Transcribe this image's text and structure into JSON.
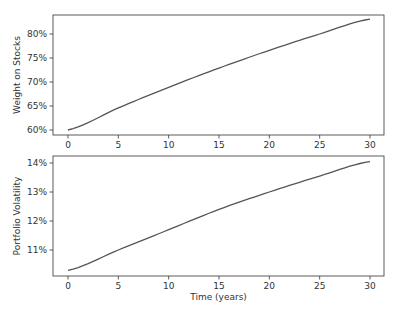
{
  "chart_data": [
    {
      "type": "line",
      "title": "",
      "xlabel": "",
      "ylabel": "Weight on Stocks",
      "x_ticks": [
        0,
        5,
        10,
        15,
        20,
        25,
        30
      ],
      "y_ticks": [
        "60%",
        "65%",
        "70%",
        "75%",
        "80%"
      ],
      "xlim": [
        -1.5,
        31.5
      ],
      "ylim": [
        59.1,
        84.1
      ],
      "grid": false,
      "series": [
        {
          "name": "Weight on Stocks",
          "color": "#555555",
          "x": [
            0,
            5,
            10,
            15,
            20,
            25,
            30
          ],
          "values": [
            60.0,
            64.6,
            68.9,
            72.9,
            76.6,
            80.0,
            83.1
          ]
        }
      ]
    },
    {
      "type": "line",
      "title": "",
      "xlabel": "Time (years)",
      "ylabel": "Portfolio Volatility",
      "x_ticks": [
        0,
        5,
        10,
        15,
        20,
        25,
        30
      ],
      "y_ticks": [
        "11%",
        "12%",
        "13%",
        "14%"
      ],
      "xlim": [
        -1.5,
        31.5
      ],
      "ylim": [
        10.1,
        14.2
      ],
      "grid": false,
      "series": [
        {
          "name": "Portfolio Volatility",
          "color": "#555555",
          "x": [
            0,
            5,
            10,
            15,
            20,
            25,
            30
          ],
          "values": [
            10.3,
            11.0,
            11.7,
            12.4,
            13.0,
            13.55,
            14.05
          ]
        }
      ]
    }
  ],
  "labels": {
    "top_ylabel": "Weight on Stocks",
    "bottom_ylabel": "Portfolio Volatility",
    "bottom_xlabel": "Time (years)"
  }
}
